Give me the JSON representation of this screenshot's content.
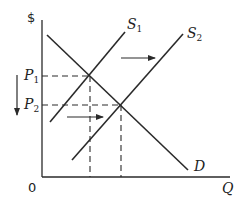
{
  "diagram": {
    "axes": {
      "y_label": "$",
      "x_label": "Q",
      "origin_label": "0"
    },
    "curves": {
      "demand": {
        "label": "D"
      },
      "supply_1": {
        "label": "S",
        "subscript": "1"
      },
      "supply_2": {
        "label": "S",
        "subscript": "2"
      }
    },
    "price_levels": [
      {
        "label": "P",
        "subscript": "1"
      },
      {
        "label": "P",
        "subscript": "2"
      }
    ],
    "annotations": {
      "supply_shift_arrows": "rightward shift of supply",
      "price_drop_arrow": "price falls from P1 to P2"
    },
    "colors": {
      "line": "#2a2a2a",
      "text": "#222222",
      "background": "#ffffff"
    }
  }
}
